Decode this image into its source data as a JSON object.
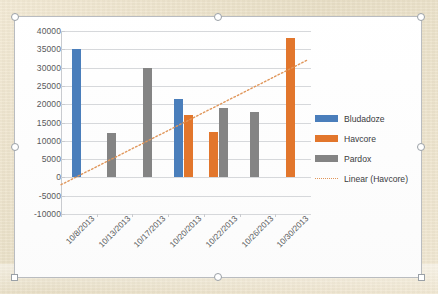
{
  "window": {
    "selected": true,
    "handle_name": "resize-handle"
  },
  "chart_data": {
    "type": "bar",
    "title": "",
    "xlabel": "",
    "ylabel": "",
    "categories": [
      "10/8/2013",
      "10/13/2013",
      "10/17/2013",
      "10/20/2013",
      "10/22/2013",
      "10/26/2013",
      "10/30/2013"
    ],
    "series": [
      {
        "name": "Bludadoze",
        "color": "#4a7ebb",
        "values": [
          35000,
          null,
          null,
          21500,
          null,
          null,
          null
        ]
      },
      {
        "name": "Havcore",
        "color": "#e2762c",
        "values": [
          null,
          null,
          null,
          17000,
          12300,
          null,
          38000
        ]
      },
      {
        "name": "Pardox",
        "color": "#848484",
        "values": [
          null,
          12000,
          30000,
          null,
          19000,
          18000,
          null
        ]
      }
    ],
    "trendline": {
      "name": "Linear (Havcore)",
      "color": "#e0965a",
      "style": "dotted",
      "start_value": -2000,
      "end_value": 32000
    },
    "ylim": [
      -10000,
      40000
    ],
    "yticks": [
      40000,
      35000,
      30000,
      25000,
      20000,
      15000,
      10000,
      5000,
      0,
      -5000,
      -10000
    ],
    "ytick_labels": [
      "40000",
      "35000",
      "30000",
      "25000",
      "20000",
      "15000",
      "10000",
      "5000",
      "0",
      "-5000",
      "-10000"
    ],
    "grid": true,
    "legend_position": "right"
  },
  "legend": {
    "entries": [
      {
        "label": "Bludadoze",
        "swatch": "bar-swatch-blue"
      },
      {
        "label": "Havcore",
        "swatch": "bar-swatch-orange"
      },
      {
        "label": "Pardox",
        "swatch": "bar-swatch-gray"
      },
      {
        "label": "Linear (Havcore)",
        "swatch": "dotted-line-swatch"
      }
    ]
  }
}
